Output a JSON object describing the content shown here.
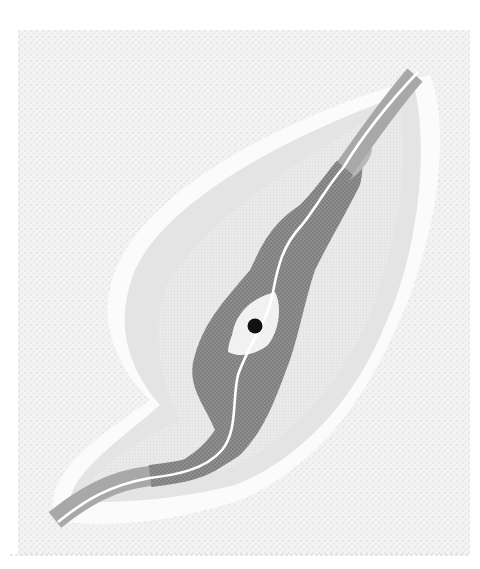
{
  "diagram": {
    "colors": {
      "background": "#ffffff",
      "outer_stipple": "#e9e9e9",
      "outer_zone": "#ececec",
      "middle_zone": "#dddddd",
      "inner_hatched_zone": "#f1f1f1",
      "core_zone": "#8c8c8c",
      "river_channel": "#a6a6a6",
      "river_line": "#ffffff",
      "source_halo": "#f4f4f4",
      "source_point": "#111111"
    },
    "zones": [
      {
        "name": "outer-stipple-field"
      },
      {
        "name": "outer-envelope-zone"
      },
      {
        "name": "middle-zone"
      },
      {
        "name": "inner-hatched-zone"
      },
      {
        "name": "core-dark-zone"
      }
    ],
    "features": [
      {
        "name": "river-channel"
      },
      {
        "name": "source-halo"
      },
      {
        "name": "source-point"
      }
    ]
  }
}
